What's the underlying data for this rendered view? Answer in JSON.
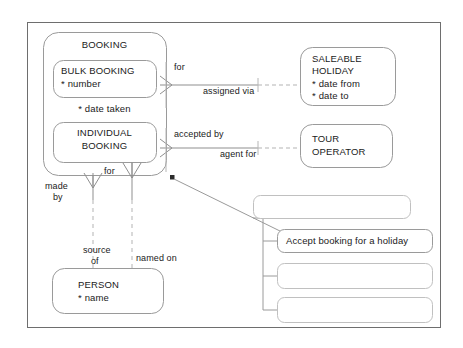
{
  "diagram": {
    "type": "entity-relationship-diagram",
    "frame": {
      "stroke": "#6e6e6e"
    },
    "colors": {
      "entity_stroke": "#9a9a9a",
      "relationship_stroke": "#9a9a9a",
      "text": "#1a1a1a",
      "marker": "#2b2b2b",
      "background": "#ffffff"
    },
    "entities": [
      {
        "id": "booking",
        "name": "BOOKING",
        "subtypes": [
          {
            "id": "bulk-booking",
            "name": "BULK BOOKING",
            "attributes": [
              "* number"
            ]
          },
          {
            "id": "individual-booking",
            "name": "INDIVIDUAL BOOKING",
            "attributes": []
          }
        ],
        "attributes": [
          "* date taken"
        ]
      },
      {
        "id": "saleable-holiday",
        "name_line1": "SALEABLE",
        "name_line2": "HOLIDAY",
        "attributes": [
          "* date from",
          "* date to"
        ]
      },
      {
        "id": "tour-operator",
        "name_line1": "TOUR",
        "name_line2": "OPERATOR",
        "attributes": []
      },
      {
        "id": "person",
        "name": "PERSON",
        "attributes": [
          "* name"
        ]
      }
    ],
    "relationships": [
      {
        "id": "for-saleable-holiday",
        "label": "for"
      },
      {
        "id": "assigned-via",
        "label": "assigned via"
      },
      {
        "id": "accepted-by",
        "label": "accepted by"
      },
      {
        "id": "agent-for",
        "label": "agent for"
      },
      {
        "id": "made-by",
        "label_line1": "made",
        "label_line2": "by"
      },
      {
        "id": "for-person",
        "label": "for"
      },
      {
        "id": "source-of",
        "label_line1": "source",
        "label_line2": "of"
      },
      {
        "id": "named-on",
        "label": "named on"
      }
    ],
    "callouts": [
      {
        "id": "callout-1",
        "text": ""
      },
      {
        "id": "callout-2",
        "text": "Accept booking for a holiday"
      },
      {
        "id": "callout-3",
        "text": ""
      },
      {
        "id": "callout-4",
        "text": ""
      }
    ]
  }
}
